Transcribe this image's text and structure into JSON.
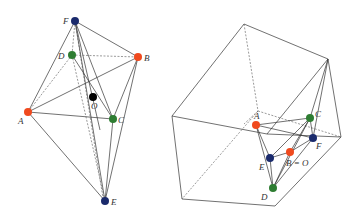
{
  "colors": {
    "red": "#f04a1e",
    "green": "#2e7d32",
    "blue": "#1a2a6c",
    "black": "#000000"
  },
  "left_figure": {
    "points": [
      {
        "name": "F",
        "label": "F",
        "x": 75,
        "y": 21,
        "color": "blue"
      },
      {
        "name": "D",
        "label": "D",
        "x": 72,
        "y": 55,
        "color": "green"
      },
      {
        "name": "B",
        "label": "B",
        "x": 138,
        "y": 57,
        "color": "red"
      },
      {
        "name": "O",
        "label": "O",
        "x": 93,
        "y": 97,
        "color": "black"
      },
      {
        "name": "A",
        "label": "A",
        "x": 28,
        "y": 112,
        "color": "red"
      },
      {
        "name": "C",
        "label": "C",
        "x": 113,
        "y": 119,
        "color": "green"
      },
      {
        "name": "E",
        "label": "E",
        "x": 105,
        "y": 201,
        "color": "blue"
      }
    ]
  },
  "right_figure": {
    "points": [
      {
        "name": "A",
        "label": "A",
        "x": 256,
        "y": 125,
        "color": "red"
      },
      {
        "name": "C",
        "label": "C",
        "x": 310,
        "y": 118,
        "color": "green"
      },
      {
        "name": "F",
        "label": "F",
        "x": 313,
        "y": 138,
        "color": "blue"
      },
      {
        "name": "B",
        "label": "B = O",
        "x": 290,
        "y": 152,
        "color": "red"
      },
      {
        "name": "E",
        "label": "E",
        "x": 270,
        "y": 158,
        "color": "blue"
      },
      {
        "name": "D",
        "label": "D",
        "x": 273,
        "y": 188,
        "color": "green"
      }
    ]
  }
}
